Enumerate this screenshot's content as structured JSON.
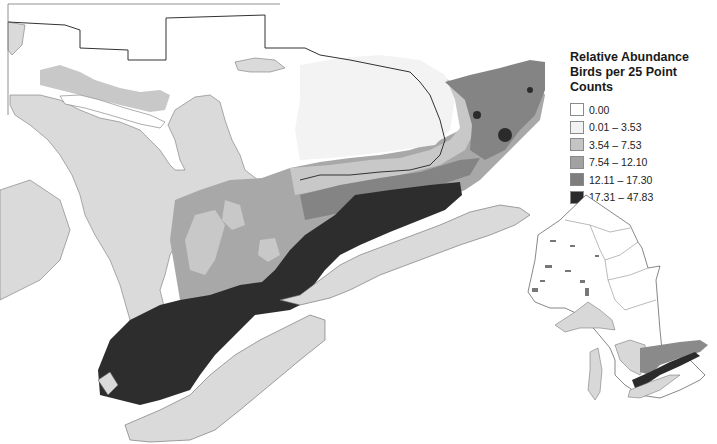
{
  "legend": {
    "title_line1": "Relative Abundance",
    "title_line2": "Birds per 25 Point Counts",
    "classes": [
      {
        "label": "0.00",
        "color": "#ffffff"
      },
      {
        "label": "0.01 – 3.53",
        "color": "#f2f2f2"
      },
      {
        "label": "3.54 – 7.53",
        "color": "#c4c4c4"
      },
      {
        "label": "7.54 – 12.10",
        "color": "#a2a2a2"
      },
      {
        "label": "12.11 – 17.30",
        "color": "#7e7e7e"
      },
      {
        "label": "17.31 – 47.83",
        "color": "#2b2b2b"
      }
    ]
  },
  "colors": {
    "water": "#dadada",
    "land_zero": "#ffffff",
    "boundary": "#444444"
  },
  "main_map": {
    "region": "Southern Ontario and Great Lakes"
  },
  "inset_map": {
    "region": "Ontario province overview"
  }
}
